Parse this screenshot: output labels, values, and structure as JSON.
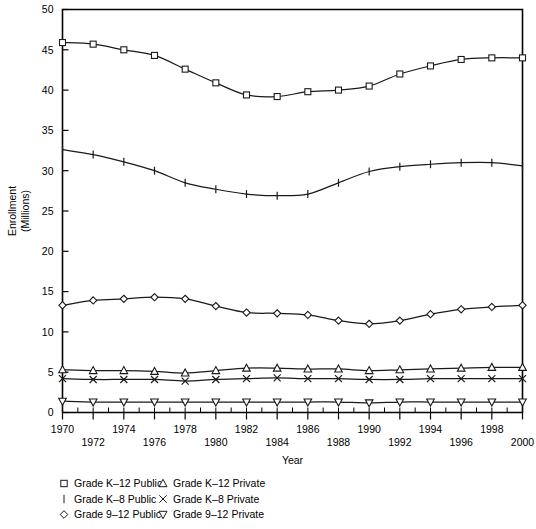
{
  "chart_data": {
    "type": "line",
    "title": "",
    "xlabel": "Year",
    "ylabel": "Enrollment\n(Millions)",
    "ylabel_line1": "Enrollment",
    "ylabel_line2": "(Millions)",
    "xlim": [
      1970,
      2000
    ],
    "ylim": [
      0,
      50
    ],
    "ytick_step": 5,
    "xtick_step": 1,
    "marker_interval_years": 2,
    "grid": false,
    "legend_position": "below-axes",
    "yticks": [
      0,
      5,
      10,
      15,
      20,
      25,
      30,
      35,
      40,
      45,
      50
    ],
    "ytick_labels": [
      "0",
      "5",
      "10",
      "15",
      "20",
      "25",
      "30",
      "35",
      "40",
      "45",
      "50"
    ],
    "xticks": [
      1970,
      1971,
      1972,
      1973,
      1974,
      1975,
      1976,
      1977,
      1978,
      1979,
      1980,
      1981,
      1982,
      1983,
      1984,
      1985,
      1986,
      1987,
      1988,
      1989,
      1990,
      1991,
      1992,
      1993,
      1994,
      1995,
      1996,
      1997,
      1998,
      1999,
      2000
    ],
    "xtick_labels_upper": [
      "1970",
      "1974",
      "1978",
      "1982",
      "1986",
      "1990",
      "1994",
      "1998"
    ],
    "xtick_labels_lower": [
      "1972",
      "1976",
      "1980",
      "1984",
      "1988",
      "1992",
      "1996",
      "2000"
    ],
    "x": [
      1970,
      1972,
      1974,
      1976,
      1978,
      1980,
      1982,
      1984,
      1986,
      1988,
      1990,
      1992,
      1994,
      1996,
      1998,
      2000
    ],
    "series": [
      {
        "name": "Grade K–12 Public",
        "marker": "square",
        "values": [
          45.9,
          45.7,
          45.0,
          44.3,
          42.6,
          40.9,
          39.4,
          39.2,
          39.8,
          40.0,
          40.5,
          42.0,
          43.0,
          43.8,
          44.0,
          44.0
        ]
      },
      {
        "name": "Grade K–8 Public",
        "marker": "bar",
        "values": [
          32.6,
          32.0,
          31.1,
          30.0,
          28.5,
          27.7,
          27.1,
          26.9,
          27.1,
          28.5,
          29.9,
          30.5,
          30.8,
          31.0,
          31.0,
          30.6
        ]
      },
      {
        "name": "Grade 9–12 Public",
        "marker": "diamond",
        "values": [
          13.3,
          13.9,
          14.1,
          14.3,
          14.1,
          13.2,
          12.4,
          12.3,
          12.1,
          11.4,
          11.0,
          11.4,
          12.2,
          12.8,
          13.1,
          13.3
        ]
      },
      {
        "name": "Grade K–12 Private",
        "marker": "triangle-up",
        "values": [
          5.3,
          5.2,
          5.2,
          5.1,
          4.9,
          5.2,
          5.5,
          5.5,
          5.4,
          5.4,
          5.2,
          5.3,
          5.4,
          5.5,
          5.6,
          5.6
        ]
      },
      {
        "name": "Grade K–8 Private",
        "marker": "cross",
        "values": [
          4.2,
          4.1,
          4.1,
          4.1,
          3.9,
          4.1,
          4.2,
          4.3,
          4.2,
          4.2,
          4.1,
          4.1,
          4.2,
          4.2,
          4.2,
          4.2
        ]
      },
      {
        "name": "Grade 9–12 Private",
        "marker": "triangle-down",
        "values": [
          1.4,
          1.3,
          1.3,
          1.3,
          1.3,
          1.3,
          1.3,
          1.3,
          1.3,
          1.3,
          1.2,
          1.3,
          1.3,
          1.3,
          1.3,
          1.3
        ]
      }
    ],
    "legend": [
      {
        "label": "Grade K–12 Public",
        "marker": "square",
        "column": 0,
        "row": 0
      },
      {
        "label": "Grade K–8 Public",
        "marker": "bar",
        "column": 0,
        "row": 1
      },
      {
        "label": "Grade 9–12 Public",
        "marker": "diamond",
        "column": 0,
        "row": 2
      },
      {
        "label": "Grade K–12 Private",
        "marker": "triangle-up",
        "column": 1,
        "row": 0
      },
      {
        "label": "Grade K–8 Private",
        "marker": "cross",
        "column": 1,
        "row": 1
      },
      {
        "label": "Grade 9–12 Private",
        "marker": "triangle-down",
        "column": 1,
        "row": 2
      }
    ],
    "colors": {
      "line": "#1a1a1a",
      "marker_fill": "#ffffff",
      "axis": "#000000",
      "background": "#ffffff"
    }
  }
}
